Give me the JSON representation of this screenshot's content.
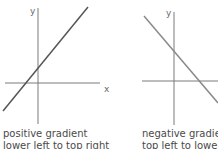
{
  "graphs": [
    {
      "id": "positive",
      "axis_labels": {
        "x": "x",
        "y": "y"
      },
      "line_color": "#555555",
      "caption": [
        "positive gradient",
        "lower left to top right"
      ]
    },
    {
      "id": "negative",
      "axis_labels": {
        "x": "x",
        "y": "y"
      },
      "line_color": "#8a8a8a",
      "caption": [
        "negative gradient",
        "top left to lower right"
      ]
    }
  ],
  "colors": {
    "axis": "#8a8a8a",
    "text": "#4a4a4a"
  }
}
